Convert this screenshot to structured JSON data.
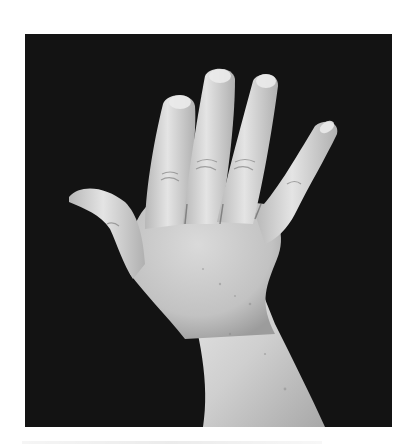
{
  "image": {
    "subject": "hand",
    "description": "Grayscale photograph of the back of a left hand with fingers spread against a black background",
    "mode": "grayscale",
    "colors": {
      "page_background": "#ffffff",
      "photo_background": "#141414",
      "skin_highlight": "#e6e6e6",
      "skin_mid": "#c4c4c4",
      "skin_shadow": "#8f8f8f"
    },
    "frame": {
      "x": 25,
      "y": 34,
      "width": 367,
      "height": 393
    }
  }
}
